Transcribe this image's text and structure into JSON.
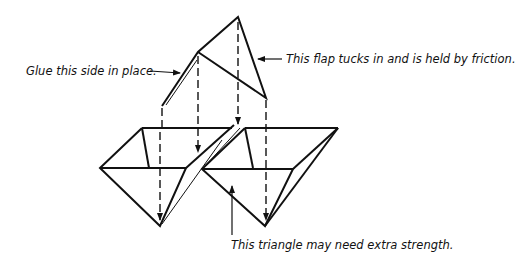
{
  "diagram": {
    "type": "assembly-illustration",
    "stroke_color": "#111111",
    "background": "#ffffff"
  },
  "labels": {
    "glue": "Glue this side in place.",
    "flap": "This flap tucks in and is held by friction.",
    "triangle": "This triangle may need extra strength."
  }
}
